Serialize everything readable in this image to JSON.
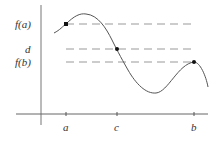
{
  "diagram": {
    "y_labels": {
      "fa": "f(a)",
      "d": "d",
      "fb": "f(b)"
    },
    "x_labels": {
      "a": "a",
      "c": "c",
      "b": "b"
    },
    "colors": {
      "axis": "#666666",
      "curve": "#555555",
      "dash": "#888888",
      "point": "#111111",
      "text": "#333333"
    },
    "points": [
      {
        "name": "point-a",
        "label": "(a, f(a))"
      },
      {
        "name": "point-c",
        "label": "(c, d)"
      },
      {
        "name": "point-b",
        "label": "(b, f(b))"
      }
    ]
  }
}
